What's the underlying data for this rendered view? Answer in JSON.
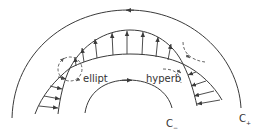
{
  "diagram": {
    "labels": {
      "ellipt": "ellipt",
      "hyperb": "hyperb",
      "c_minus_main": "C",
      "c_minus_sub": "−",
      "c_plus_main": "C",
      "c_plus_sub": "+"
    },
    "colors": {
      "stroke": "#3a3a3a",
      "dashed": "#555555",
      "background": "#ffffff"
    },
    "elements": [
      "outer-contour-c-plus (arrow pointing left at top)",
      "inner-contour-c-minus (arrow pointing right at top)",
      "band with two crossing boundary curves",
      "upward arrows in top band region",
      "rightward arrows in left band region (ellipt)",
      "leftward arrows in right band region (hyperb)",
      "dashed rotation circle at left crossing",
      "dashed rotation arcs at right crossing"
    ]
  }
}
